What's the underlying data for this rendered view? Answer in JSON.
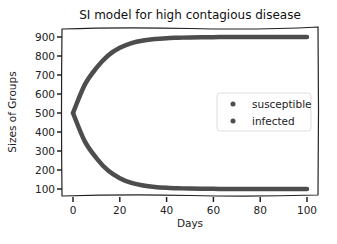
{
  "chart_data": {
    "type": "line",
    "title": "SI model for high contagious disease",
    "xlabel": "Days",
    "ylabel": "Sizes of Groups",
    "xlim": [
      0,
      100
    ],
    "ylim": [
      100,
      900
    ],
    "xticks": [
      0,
      20,
      40,
      60,
      80,
      100
    ],
    "yticks": [
      100,
      200,
      300,
      400,
      500,
      600,
      700,
      800,
      900
    ],
    "grid": false,
    "legend_position": "center right",
    "style": "xkcd hand-drawn",
    "x": [
      0,
      5,
      10,
      15,
      20,
      25,
      30,
      35,
      40,
      45,
      50,
      55,
      60,
      65,
      70,
      75,
      80,
      85,
      90,
      95,
      100
    ],
    "series": [
      {
        "name": "susceptible",
        "color": "#4d4d4d",
        "values": [
          500,
          352,
          263,
          197,
          157,
          132,
          118,
          110,
          106,
          104,
          102,
          101,
          101,
          100,
          100,
          100,
          100,
          100,
          100,
          100,
          100
        ]
      },
      {
        "name": "infected",
        "color": "#4d4d4d",
        "values": [
          500,
          648,
          737,
          803,
          843,
          868,
          882,
          890,
          894,
          896,
          898,
          899,
          899,
          900,
          900,
          900,
          900,
          900,
          900,
          900,
          900
        ]
      }
    ]
  },
  "legend": {
    "items": [
      {
        "label": "susceptible"
      },
      {
        "label": "infected"
      }
    ]
  }
}
